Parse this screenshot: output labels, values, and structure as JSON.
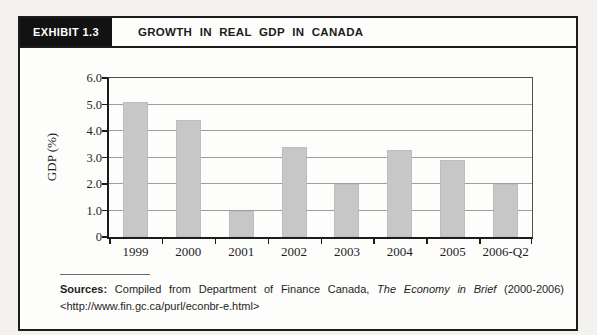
{
  "exhibit": {
    "label": "EXHIBIT 1.3",
    "title": "GROWTH IN REAL GDP IN CANADA"
  },
  "chart_data": {
    "type": "bar",
    "title": "",
    "categories": [
      "1999",
      "2000",
      "2001",
      "2002",
      "2003",
      "2004",
      "2005",
      "2006-Q2"
    ],
    "values": [
      5.1,
      4.4,
      1.0,
      3.4,
      2.0,
      3.3,
      2.9,
      2.0
    ],
    "xlabel": "",
    "ylabel": "GDP (%)",
    "ylim": [
      0,
      6
    ],
    "y_tick_values": [
      6,
      5,
      4,
      3,
      2,
      1,
      0
    ],
    "y_tick_labels": [
      "6.0",
      "5.0",
      "4.0",
      "3.0",
      "2.0",
      "1.0",
      "0"
    ],
    "grid": "horizontal",
    "legend": "none",
    "bar_color": "#c7c7c7"
  },
  "footer": {
    "sources_label": "Sources:",
    "sources_text": "Compiled from Department of Finance Canada,",
    "sources_work": "The Economy in Brief",
    "sources_years": "(2000-2006)",
    "sources_url": "<http://www.fin.gc.ca/purl/econbr-e.html>"
  }
}
